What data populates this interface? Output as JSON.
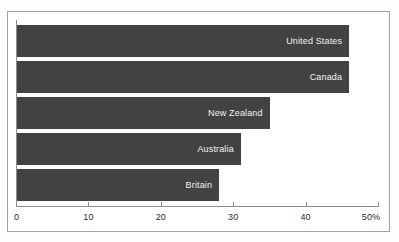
{
  "figure": {
    "title_sliver": "",
    "frame_color": "#a2a2a2",
    "background": "#ffffff"
  },
  "chart_data": {
    "type": "bar",
    "orientation": "horizontal",
    "title": "",
    "xlabel": "",
    "ylabel": "",
    "xlim": [
      0,
      50
    ],
    "grid": false,
    "legend": false,
    "bar_color": "#424242",
    "label_color": "#f2f2f2",
    "categories": [
      "United States",
      "Canada",
      "New Zealand",
      "Australia",
      "Britain"
    ],
    "values": [
      46,
      46,
      35,
      31,
      28
    ],
    "tick_values": [
      0,
      10,
      20,
      30,
      40,
      50
    ],
    "tick_labels": [
      "0",
      "10",
      "20",
      "30",
      "40",
      "50%"
    ],
    "bars": [
      {
        "label": "United States",
        "value": 46
      },
      {
        "label": "Canada",
        "value": 46
      },
      {
        "label": "New Zealand",
        "value": 35
      },
      {
        "label": "Australia",
        "value": 31
      },
      {
        "label": "Britain",
        "value": 28
      }
    ]
  }
}
